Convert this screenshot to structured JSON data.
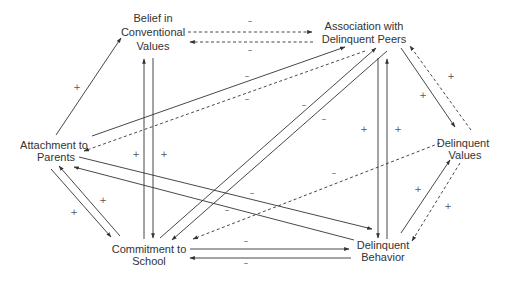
{
  "diagram": {
    "type": "causal path diagram",
    "nodes": {
      "belief": {
        "line1": "Belief in",
        "line2": "Conventional",
        "line3": "Values"
      },
      "peers": {
        "line1": "Association with",
        "line2": "Delinquent Peers"
      },
      "attachment": {
        "line1": "Attachment to",
        "line2": "Parents"
      },
      "delvalues": {
        "line1": "Delinquent",
        "line2": "Values"
      },
      "school": {
        "line1": "Commitment to",
        "line2": "School"
      },
      "behavior": {
        "line1": "Delinquent",
        "line2": "Behavior"
      }
    },
    "edges": [
      {
        "from": "Belief in Conventional Values",
        "to": "Association with Delinquent Peers",
        "style": "dashed",
        "sign": "–"
      },
      {
        "from": "Association with Delinquent Peers",
        "to": "Belief in Conventional Values",
        "style": "dashed",
        "sign": "–"
      },
      {
        "from": "Attachment to Parents",
        "to": "Belief in Conventional Values",
        "style": "solid",
        "sign": "+"
      },
      {
        "from": "Attachment to Parents",
        "to": "Association with Delinquent Peers",
        "style": "solid",
        "sign": "–"
      },
      {
        "from": "Association with Delinquent Peers",
        "to": "Attachment to Parents",
        "style": "dashed",
        "sign": "–"
      },
      {
        "from": "Commitment to School",
        "to": "Belief in Conventional Values",
        "style": "solid",
        "sign": "+"
      },
      {
        "from": "Belief in Conventional Values",
        "to": "Commitment to School",
        "style": "solid",
        "sign": "+"
      },
      {
        "from": "Commitment to School",
        "to": "Association with Delinquent Peers",
        "style": "solid",
        "sign": "–"
      },
      {
        "from": "Association with Delinquent Peers",
        "to": "Commitment to School",
        "style": "solid",
        "sign": "–"
      },
      {
        "from": "Association with Delinquent Peers",
        "to": "Delinquent Behavior",
        "style": "solid",
        "sign": "+"
      },
      {
        "from": "Delinquent Behavior",
        "to": "Association with Delinquent Peers",
        "style": "solid",
        "sign": "+"
      },
      {
        "from": "Association with Delinquent Peers",
        "to": "Delinquent Values",
        "style": "solid",
        "sign": "+"
      },
      {
        "from": "Delinquent Values",
        "to": "Association with Delinquent Peers",
        "style": "dashed",
        "sign": "+"
      },
      {
        "from": "Attachment to Parents",
        "to": "Commitment to School",
        "style": "solid",
        "sign": "+"
      },
      {
        "from": "Commitment to School",
        "to": "Attachment to Parents",
        "style": "solid",
        "sign": "+"
      },
      {
        "from": "Attachment to Parents",
        "to": "Delinquent Behavior",
        "style": "solid",
        "sign": "–"
      },
      {
        "from": "Delinquent Behavior",
        "to": "Attachment to Parents",
        "style": "solid",
        "sign": "–"
      },
      {
        "from": "Delinquent Values",
        "to": "Commitment to School",
        "style": "dashed",
        "sign": "–"
      },
      {
        "from": "Commitment to School",
        "to": "Delinquent Behavior",
        "style": "solid",
        "sign": "–"
      },
      {
        "from": "Delinquent Behavior",
        "to": "Commitment to School",
        "style": "solid",
        "sign": "–"
      },
      {
        "from": "Delinquent Behavior",
        "to": "Delinquent Values",
        "style": "solid",
        "sign": "+"
      },
      {
        "from": "Delinquent Values",
        "to": "Delinquent Behavior",
        "style": "dashed",
        "sign": "+"
      }
    ],
    "signs": {
      "plus": "+",
      "minus": "–"
    }
  }
}
